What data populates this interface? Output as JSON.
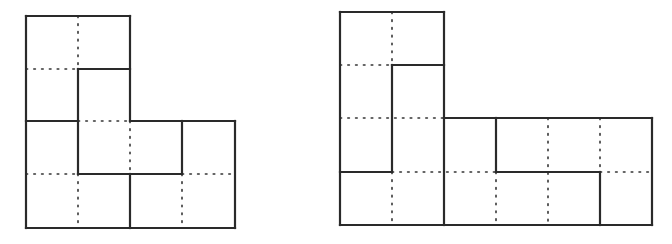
{
  "colors": {
    "line": "#2a2a2a",
    "background": "#ffffff"
  },
  "figures": [
    {
      "name": "left-figure",
      "unit": 52,
      "solid_segments": [
        [
          26,
          16,
          130,
          16
        ],
        [
          130,
          16,
          130,
          121
        ],
        [
          130,
          121,
          235,
          121
        ],
        [
          235,
          121,
          235,
          228
        ],
        [
          26,
          228,
          235,
          228
        ],
        [
          26,
          16,
          26,
          228
        ],
        [
          78,
          69,
          130,
          69
        ],
        [
          78,
          69,
          78,
          174
        ],
        [
          26,
          121,
          78,
          121
        ],
        [
          78,
          174,
          182,
          174
        ],
        [
          182,
          121,
          182,
          174
        ],
        [
          130,
          174,
          130,
          228
        ]
      ],
      "dotted_segments": [
        [
          78,
          16,
          78,
          69
        ],
        [
          26,
          69,
          78,
          69
        ],
        [
          78,
          121,
          130,
          121
        ],
        [
          130,
          121,
          130,
          174
        ],
        [
          26,
          174,
          78,
          174
        ],
        [
          78,
          174,
          78,
          228
        ],
        [
          182,
          174,
          235,
          174
        ],
        [
          182,
          174,
          182,
          228
        ]
      ]
    },
    {
      "name": "right-figure",
      "unit": 52,
      "solid_segments": [
        [
          340,
          12,
          444,
          12
        ],
        [
          444,
          12,
          444,
          118
        ],
        [
          444,
          118,
          652,
          118
        ],
        [
          652,
          118,
          652,
          225
        ],
        [
          340,
          225,
          652,
          225
        ],
        [
          340,
          12,
          340,
          225
        ],
        [
          392,
          65,
          444,
          65
        ],
        [
          392,
          65,
          392,
          172
        ],
        [
          340,
          172,
          392,
          172
        ],
        [
          444,
          118,
          444,
          225
        ],
        [
          496,
          118,
          496,
          172
        ],
        [
          496,
          172,
          600,
          172
        ],
        [
          600,
          172,
          600,
          225
        ]
      ],
      "dotted_segments": [
        [
          392,
          12,
          392,
          65
        ],
        [
          340,
          65,
          392,
          65
        ],
        [
          340,
          118,
          444,
          118
        ],
        [
          392,
          172,
          496,
          172
        ],
        [
          392,
          172,
          392,
          225
        ],
        [
          496,
          172,
          496,
          225
        ],
        [
          548,
          118,
          548,
          225
        ],
        [
          600,
          118,
          600,
          172
        ],
        [
          600,
          172,
          652,
          172
        ]
      ]
    }
  ]
}
